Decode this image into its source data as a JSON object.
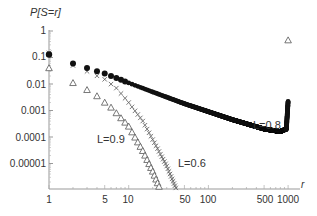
{
  "chart_data": {
    "type": "scatter",
    "title": "",
    "ylabel": "P[S=r]",
    "xlabel": "r",
    "xscale": "log",
    "yscale": "log",
    "xlim": [
      1,
      1000
    ],
    "ylim": [
      1e-06,
      1
    ],
    "x_ticks": [
      "1",
      "5",
      "10",
      "50",
      "100",
      "500",
      "1000"
    ],
    "y_ticks": [
      "1",
      "0.1",
      "0.01",
      "0.001",
      "0.0001",
      "0.00001"
    ],
    "grid": false,
    "legend": "none (inline annotations)",
    "annotations": [
      "L=0.8",
      "L=0.9",
      "L=0.6"
    ],
    "series": [
      {
        "name": "L=0.8",
        "marker": "filled circle",
        "description": "Power-law decay from ~0.13 at r=1 to ~0.00015 near r=900, then sharp uptick to ~0.002 at r=1000",
        "points": [
          [
            1,
            0.13
          ],
          [
            2,
            0.06
          ],
          [
            3,
            0.04
          ],
          [
            4,
            0.03
          ],
          [
            5,
            0.025
          ],
          [
            6,
            0.02
          ],
          [
            7,
            0.017
          ],
          [
            10,
            0.011
          ],
          [
            20,
            0.005
          ],
          [
            50,
            0.0018
          ],
          [
            100,
            0.0009
          ],
          [
            200,
            0.00045
          ],
          [
            500,
            0.0002
          ],
          [
            800,
            0.00016
          ],
          [
            950,
            0.0002
          ],
          [
            1000,
            0.0022
          ]
        ]
      },
      {
        "name": "L=0.9",
        "marker": "open triangle",
        "description": "Steep decay from ~0.04 at r=1 to below 1e-6 near r=25; isolated point ~0.45 at r=1000",
        "points": [
          [
            1,
            0.04
          ],
          [
            2,
            0.011
          ],
          [
            3,
            0.006
          ],
          [
            4,
            0.0035
          ],
          [
            5,
            0.002
          ],
          [
            6,
            0.0013
          ],
          [
            7,
            0.0008
          ],
          [
            10,
            0.00025
          ],
          [
            15,
            3e-05
          ],
          [
            20,
            5e-06
          ],
          [
            25,
            1e-06
          ],
          [
            1000,
            0.45
          ]
        ]
      },
      {
        "name": "L=0.6",
        "marker": "cross (x)",
        "description": "Decay from ~0.15 at r=1, tracking close to L=0.8 early then dropping steeply below 1e-6 near r=40",
        "points": [
          [
            1,
            0.15
          ],
          [
            2,
            0.05
          ],
          [
            3,
            0.03
          ],
          [
            5,
            0.015
          ],
          [
            7,
            0.007
          ],
          [
            10,
            0.002
          ],
          [
            15,
            0.0004
          ],
          [
            20,
            8e-05
          ],
          [
            30,
            8e-06
          ],
          [
            40,
            1e-06
          ]
        ]
      }
    ]
  }
}
